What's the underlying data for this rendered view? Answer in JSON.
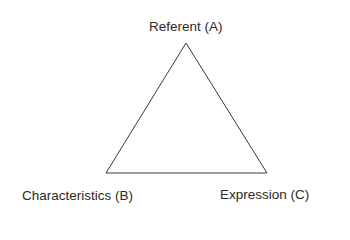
{
  "diagram": {
    "type": "triangle",
    "line_color": "#3a3a3a",
    "vertices": {
      "top": {
        "label": "Referent (A)"
      },
      "bottom_left": {
        "label": "Characteristics (B)"
      },
      "bottom_right": {
        "label": "Expression (C)"
      }
    }
  }
}
